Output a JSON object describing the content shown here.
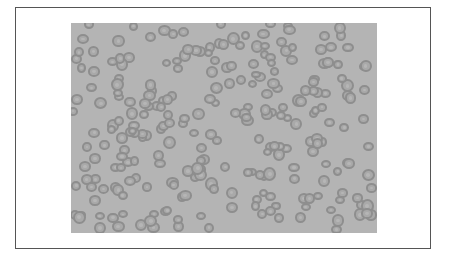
{
  "figure": {
    "colors": {
      "background": "#b4b4b4",
      "cell_rim": "#8e8e8e",
      "cell_fill": "#a9a9a9",
      "frame_border": "#555555"
    }
  }
}
